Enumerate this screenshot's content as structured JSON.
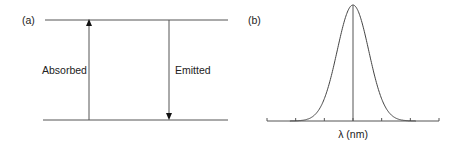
{
  "panel_a": {
    "label": "(a)",
    "absorbed_label": "Absorbed",
    "emitted_label": "Emitted"
  },
  "panel_b": {
    "label": "(b)",
    "xlabel": "λ (nm)"
  },
  "chart_data": {
    "type": "line",
    "title": "",
    "xlabel": "λ (nm)",
    "ylabel": "",
    "x_ticks": 7,
    "tick_labels": [],
    "series": [
      {
        "name": "emission spectrum",
        "shape": "gaussian",
        "center_tick_index": 3,
        "sigma_ticks": 0.55,
        "peak": 1.0
      }
    ],
    "marker_line_at_tick_index": 3,
    "grid": false,
    "legend": "none"
  }
}
